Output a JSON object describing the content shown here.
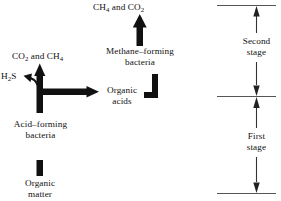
{
  "diagram": {
    "ink_color": "#111111",
    "rule_color": "#555555",
    "labels": {
      "top_products": "CH₄ and CO₂",
      "left_products": "CO₂ and CH₄",
      "hydrogen_sulfide": "H₂S",
      "methane_bacteria": "Methane–forming\nbacteria",
      "organic_acids": "Organic\nacids",
      "acid_bacteria": "Acid–forming\nbacteria",
      "organic_matter": "Organic\nmatter",
      "second_stage": "Second\nstage",
      "first_stage": "First\nstage"
    },
    "label_parts": {
      "top_products": {
        "pre": "CH",
        "sub1": "4",
        "mid": " and CO",
        "sub2": "2"
      },
      "left_products": {
        "pre": "CO",
        "sub1": "2",
        "mid": " and CH",
        "sub2": "4"
      },
      "hydrogen_sulfide": {
        "pre": "H",
        "sub1": "2",
        "mid": "S",
        "sub2": ""
      }
    },
    "stage_brackets": [
      {
        "name": "second-stage",
        "label": "Second\nstage",
        "top_rule_y": 5,
        "bottom_rule_y": 96
      },
      {
        "name": "first-stage",
        "label": "First\nstage",
        "top_rule_y": 96,
        "bottom_rule_y": 193
      }
    ],
    "rules": [
      5,
      96,
      193
    ],
    "flow_steps": [
      "Organic matter",
      "Acid–forming bacteria",
      "Organic acids",
      "Methane–forming bacteria",
      "CH₄ and CO₂"
    ],
    "byproducts": [
      "CO₂ and CH₄",
      "H₂S"
    ]
  }
}
